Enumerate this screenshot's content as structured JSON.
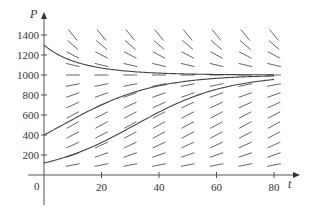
{
  "chart_data": {
    "type": "line",
    "title": "",
    "subtitle": "Direction field for logistic equation with solution curves",
    "xlabel": "t",
    "ylabel": "P",
    "xlim": [
      0,
      84
    ],
    "ylim": [
      -60,
      1500
    ],
    "x_ticks": [
      20,
      40,
      60,
      80
    ],
    "y_ticks": [
      200,
      400,
      600,
      800,
      1000,
      1200,
      1400
    ],
    "origin_label": "0",
    "grid": false,
    "legend": null,
    "model": {
      "equation": "dP/dt = kP(1 - P/M)",
      "k": 0.063,
      "M": 1000
    },
    "equilibrium": 1000,
    "slope_field": {
      "t_values": [
        10,
        20,
        30,
        40,
        50,
        60,
        70,
        80
      ],
      "P_values": [
        100,
        200,
        300,
        400,
        500,
        600,
        700,
        800,
        900,
        1000,
        1100,
        1200,
        1300,
        1400
      ]
    },
    "series": [
      {
        "name": "P0=1300",
        "P0": 1300,
        "x": [
          0,
          10,
          20,
          30,
          40,
          60,
          80
        ],
        "values": [
          1300,
          1110,
          1040,
          1015,
          1005,
          1001,
          1000
        ]
      },
      {
        "name": "P0=400",
        "P0": 400,
        "x": [
          0,
          10,
          20,
          30,
          40,
          60,
          80
        ],
        "values": [
          400,
          558,
          705,
          824,
          900,
          971,
          992
        ]
      },
      {
        "name": "P0=120",
        "P0": 120,
        "x": [
          0,
          10,
          20,
          30,
          40,
          60,
          80
        ],
        "values": [
          120,
          200,
          325,
          480,
          635,
          855,
          955
        ]
      }
    ]
  }
}
